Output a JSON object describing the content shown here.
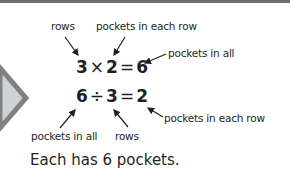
{
  "colors": {
    "text": "#231f20",
    "top_bar": "#6d6e70",
    "chevron_fill": "#d1d2d4",
    "chevron_border": "#808184"
  },
  "labels": {
    "rows_top": "rows",
    "pockets_each_row_top": "pockets in each row",
    "pockets_in_all_right": "pockets in all",
    "pockets_in_all_bottom": "pockets in all",
    "rows_bottom": "rows",
    "pockets_each_row_right": "pockets in each row"
  },
  "multiplication": {
    "a": "3",
    "op": "×",
    "b": "2",
    "eq": "=",
    "result": "6"
  },
  "division": {
    "a": "6",
    "op": "÷",
    "b": "3",
    "eq": "=",
    "result": "2"
  },
  "caption": "Each has 6 pockets."
}
